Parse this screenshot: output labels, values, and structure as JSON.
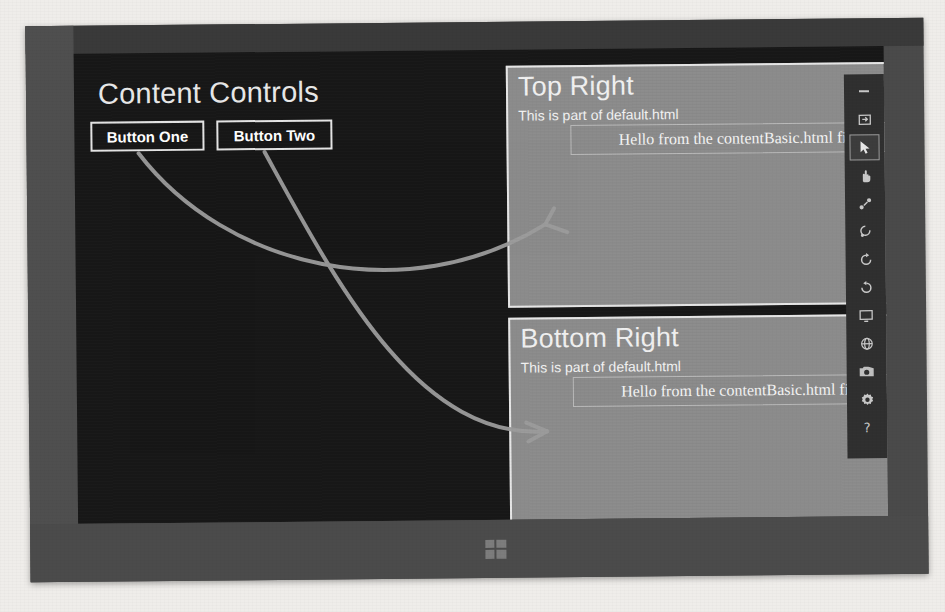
{
  "app": {
    "title": "Content Controls",
    "buttons": [
      {
        "label": "Button One",
        "name": "button-one"
      },
      {
        "label": "Button Two",
        "name": "button-two"
      }
    ]
  },
  "panels": [
    {
      "id": "top-right",
      "title": "Top Right",
      "subtitle": "This is part of default.html",
      "content_text": "Hello from the contentBasic.html file"
    },
    {
      "id": "bottom-right",
      "title": "Bottom Right",
      "subtitle": "This is part of default.html",
      "content_text": "Hello from the contentBasic.html file"
    }
  ],
  "simulator_toolbar": {
    "items": [
      {
        "name": "minimize-icon",
        "glyph": "–",
        "selected": false
      },
      {
        "name": "fit-to-screen-icon",
        "glyph": "⇲",
        "selected": false
      },
      {
        "name": "mouse-pointer-icon",
        "glyph": "➤",
        "selected": true
      },
      {
        "name": "basic-touch-mode-icon",
        "glyph": "✋",
        "selected": false
      },
      {
        "name": "pinch-zoom-touch-icon",
        "glyph": "⁙",
        "selected": false
      },
      {
        "name": "rotate-gesture-icon",
        "glyph": "↺",
        "selected": false
      },
      {
        "name": "rotate-clockwise-icon",
        "glyph": "↻",
        "selected": false
      },
      {
        "name": "rotate-counterclockwise-icon",
        "glyph": "↺",
        "selected": false
      },
      {
        "name": "change-resolution-icon",
        "glyph": "▣",
        "selected": false
      },
      {
        "name": "network-properties-icon",
        "glyph": "⊕",
        "selected": false
      },
      {
        "name": "screenshot-camera-icon",
        "glyph": "◉",
        "selected": false
      },
      {
        "name": "settings-gear-icon",
        "glyph": "⚙",
        "selected": false
      },
      {
        "name": "help-icon",
        "glyph": "?",
        "selected": false
      }
    ]
  },
  "taskbar": {
    "start_button_name": "windows-start-button"
  },
  "colors": {
    "app_background": "#171717",
    "panel_background": "#8b8b8b",
    "panel_border": "#e6e6e6",
    "button_border": "#e4e4e4",
    "text_primary": "#ffffff",
    "annotation_stroke": "#9c9c9c",
    "bezel": "#4a4a4a",
    "toolbar_background": "#2f2f2f"
  },
  "annotations": {
    "arrows": [
      {
        "name": "arrow-button-one-to-top-right",
        "from": "Button One",
        "to": "Top Right content box"
      },
      {
        "name": "arrow-button-two-to-bottom-right",
        "from": "Button Two",
        "to": "Bottom Right content box"
      }
    ]
  }
}
